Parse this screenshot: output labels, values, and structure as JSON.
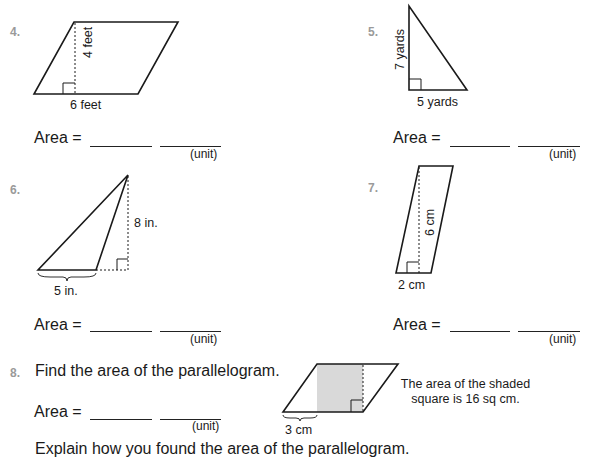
{
  "problems": [
    {
      "number": "4.",
      "shape": "parallelogram",
      "labels": {
        "height": "4 feet",
        "base": "6 feet"
      },
      "area_label": "Area =",
      "unit_label": "(unit)"
    },
    {
      "number": "5.",
      "shape": "right-triangle",
      "labels": {
        "height": "7 yards",
        "base": "5 yards"
      },
      "area_label": "Area =",
      "unit_label": "(unit)"
    },
    {
      "number": "6.",
      "shape": "obtuse-triangle",
      "labels": {
        "height": "8 in.",
        "base": "5 in."
      },
      "area_label": "Area =",
      "unit_label": "(unit)"
    },
    {
      "number": "7.",
      "shape": "parallelogram",
      "labels": {
        "height": "6 cm",
        "base": "2 cm"
      },
      "area_label": "Area =",
      "unit_label": "(unit)"
    },
    {
      "number": "8.",
      "prompt": "Find the area of the parallelogram.",
      "shape": "parallelogram-with-shaded-square",
      "labels": {
        "base_part": "3 cm"
      },
      "note_line1": "The area of the shaded",
      "note_line2": "square is 16 sq cm.",
      "area_label": "Area =",
      "unit_label": "(unit)",
      "explain": "Explain how you found the area of the parallelogram."
    }
  ],
  "colors": {
    "number": "#9a9a9a",
    "ink": "#1a1a1a",
    "shade": "#d9d9d9"
  }
}
